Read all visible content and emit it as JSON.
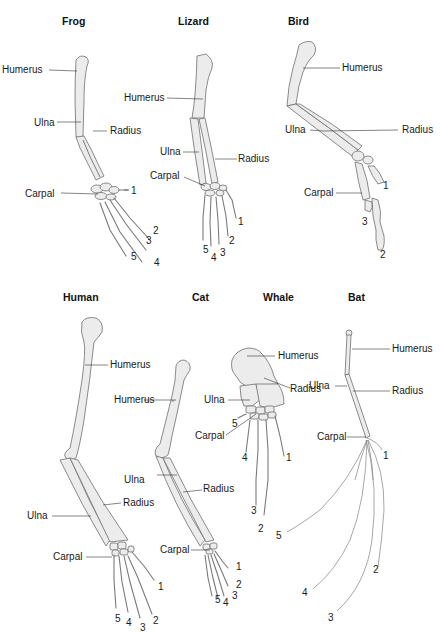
{
  "figure": {
    "type": "homologous-forelimb-comparison",
    "panels": [
      {
        "id": "frog",
        "title": "Frog",
        "labels": {
          "humerus": "Humerus",
          "ulna": "Ulna",
          "radius": "Radius",
          "carpal": "Carpal"
        },
        "digits": [
          "1",
          "2",
          "3",
          "4",
          "5"
        ]
      },
      {
        "id": "lizard",
        "title": "Lizard",
        "labels": {
          "humerus": "Humerus",
          "ulna": "Ulna",
          "radius": "Radius",
          "carpal": "Carpal"
        },
        "digits": [
          "1",
          "2",
          "3",
          "4",
          "5"
        ]
      },
      {
        "id": "bird",
        "title": "Bird",
        "labels": {
          "humerus": "Humerus",
          "ulna": "Ulna",
          "radius": "Radius",
          "carpal": "Carpal"
        },
        "digits": [
          "1",
          "2",
          "3"
        ]
      },
      {
        "id": "human",
        "title": "Human",
        "labels": {
          "humerus": "Humerus",
          "ulna": "Ulna",
          "radius": "Radius",
          "carpal": "Carpal"
        },
        "digits": [
          "1",
          "2",
          "3",
          "4",
          "5"
        ]
      },
      {
        "id": "cat",
        "title": "Cat",
        "labels": {
          "humerus": "Humerus",
          "ulna": "Ulna",
          "radius": "Radius",
          "carpal": "Carpal"
        },
        "digits": [
          "1",
          "2",
          "3",
          "4",
          "5"
        ]
      },
      {
        "id": "whale",
        "title": "Whale",
        "labels": {
          "humerus": "Humerus",
          "ulna": "Ulna",
          "radius": "Radius",
          "carpal": "Carpal"
        },
        "digits": [
          "1",
          "2",
          "3",
          "4",
          "5"
        ]
      },
      {
        "id": "bat",
        "title": "Bat",
        "labels": {
          "humerus": "Humerus",
          "ulna": "Ulna",
          "radius": "Radius",
          "carpal": "Carpal"
        },
        "digits": [
          "1",
          "2",
          "3",
          "4",
          "5"
        ]
      }
    ],
    "colors": {
      "bone_fill": "#ececec",
      "bone_stroke": "#6e6e6e",
      "text": "#1a1a1a",
      "background": "#ffffff"
    }
  }
}
